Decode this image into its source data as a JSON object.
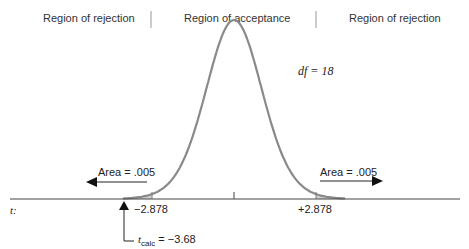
{
  "header": {
    "regions": [
      {
        "label": "Region of rejection"
      },
      {
        "label": "Region of acceptance"
      },
      {
        "label": "Region of rejection"
      }
    ]
  },
  "diagram": {
    "df_label": "df = 18",
    "left_area_label": "Area = .005",
    "right_area_label": "Area = .005",
    "axis_label": "t:",
    "left_critical": "−2.878",
    "right_critical": "+2.878",
    "tcalc_symbol": "t",
    "tcalc_subscript": "calc",
    "tcalc_value": "= −3.68",
    "curve_color": "#8a8a8a",
    "shade_color": "#d0d0d0"
  },
  "chart_data": {
    "type": "area",
    "title": "",
    "distribution": "t",
    "df": 18,
    "critical_values": [
      -2.878,
      2.878
    ],
    "tail_areas": [
      0.005,
      0.005
    ],
    "t_calc": -3.68,
    "regions": [
      "Region of rejection",
      "Region of acceptance",
      "Region of rejection"
    ],
    "xlabel": "t:"
  }
}
